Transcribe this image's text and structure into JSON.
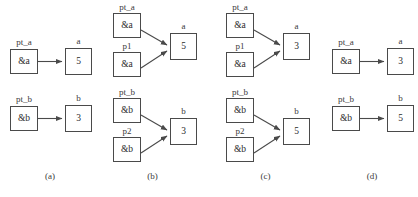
{
  "figure": {
    "type": "pointer-swap-diagram",
    "background": "#ffffff",
    "box_border_color": "#4a4a4a",
    "text_color": "#3a3a3a",
    "arrow_color": "#4a4a4a",
    "bottom_cut_text": ""
  },
  "panels": [
    {
      "caption": "(a)",
      "rows": [
        {
          "target_label": "a",
          "target_value": "5",
          "pointers": [
            {
              "label": "pt_a",
              "value": "&a"
            }
          ]
        },
        {
          "target_label": "b",
          "target_value": "3",
          "pointers": [
            {
              "label": "pt_b",
              "value": "&b"
            }
          ]
        }
      ]
    },
    {
      "caption": "(b)",
      "rows": [
        {
          "target_label": "a",
          "target_value": "5",
          "pointers": [
            {
              "label": "pt_a",
              "value": "&a"
            },
            {
              "label": "p1",
              "value": "&a"
            }
          ]
        },
        {
          "target_label": "b",
          "target_value": "3",
          "pointers": [
            {
              "label": "pt_b",
              "value": "&b"
            },
            {
              "label": "p2",
              "value": "&b"
            }
          ]
        }
      ]
    },
    {
      "caption": "(c)",
      "rows": [
        {
          "target_label": "a",
          "target_value": "3",
          "pointers": [
            {
              "label": "pt_a",
              "value": "&a"
            },
            {
              "label": "p1",
              "value": "&a"
            }
          ]
        },
        {
          "target_label": "b",
          "target_value": "5",
          "pointers": [
            {
              "label": "pt_b",
              "value": "&b"
            },
            {
              "label": "p2",
              "value": "&b"
            }
          ]
        }
      ]
    },
    {
      "caption": "(d)",
      "rows": [
        {
          "target_label": "a",
          "target_value": "3",
          "pointers": [
            {
              "label": "pt_a",
              "value": "&a"
            }
          ]
        },
        {
          "target_label": "b",
          "target_value": "5",
          "pointers": [
            {
              "label": "pt_b",
              "value": "&b"
            }
          ]
        }
      ]
    }
  ]
}
